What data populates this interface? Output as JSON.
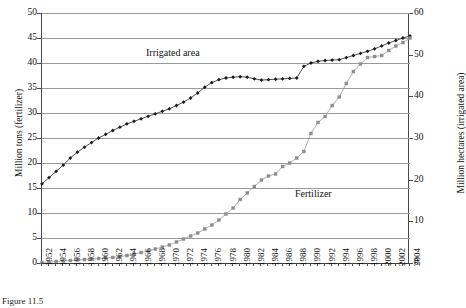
{
  "chart_data": {
    "type": "line",
    "title": "",
    "xlabel": "",
    "grid": true,
    "legend_position": "inline-annotation",
    "x": [
      1952,
      1953,
      1954,
      1955,
      1956,
      1957,
      1958,
      1959,
      1960,
      1961,
      1962,
      1963,
      1964,
      1965,
      1966,
      1967,
      1968,
      1969,
      1970,
      1971,
      1972,
      1973,
      1974,
      1975,
      1976,
      1977,
      1978,
      1979,
      1980,
      1981,
      1982,
      1983,
      1984,
      1985,
      1986,
      1987,
      1988,
      1989,
      1990,
      1991,
      1992,
      1993,
      1994,
      1995,
      1996,
      1997,
      1998,
      1999,
      2000,
      2001,
      2002,
      2003,
      2004
    ],
    "xtick_labels": [
      "1952",
      "1954",
      "1956",
      "1958",
      "1960",
      "1962",
      "1964",
      "1966",
      "1968",
      "1970",
      "1972",
      "1974",
      "1976",
      "1978",
      "1980",
      "1982",
      "1984",
      "1986",
      "1988",
      "1990",
      "1992",
      "1994",
      "1996",
      "1998",
      "2000",
      "2002",
      "2004"
    ],
    "axes": [
      {
        "id": "left",
        "ylabel": "Million tons (fertilizer)",
        "ylim": [
          0,
          50
        ],
        "yticks": [
          0,
          5,
          10,
          15,
          20,
          25,
          30,
          35,
          40,
          45,
          50
        ]
      },
      {
        "id": "right",
        "ylabel": "Million hectares (irrigated area)",
        "ylim": [
          0,
          60
        ],
        "yticks": [
          0,
          10,
          20,
          30,
          40,
          50,
          60
        ]
      }
    ],
    "series": [
      {
        "name": "Irrigated area",
        "axis": "right",
        "unit": "Million hectares",
        "color": "#1a1a1a",
        "marker": "diamond",
        "values": [
          19.0,
          20.5,
          22.0,
          23.5,
          25.2,
          26.6,
          27.8,
          28.9,
          30.0,
          30.9,
          31.8,
          32.6,
          33.4,
          34.0,
          34.6,
          35.2,
          35.8,
          36.4,
          37.0,
          37.8,
          38.6,
          39.6,
          40.8,
          42.2,
          43.3,
          44.0,
          44.4,
          44.6,
          44.7,
          44.6,
          44.2,
          43.9,
          44.0,
          44.1,
          44.2,
          44.3,
          44.4,
          47.2,
          48.0,
          48.4,
          48.6,
          48.7,
          48.8,
          49.3,
          49.8,
          50.3,
          50.8,
          51.4,
          52.1,
          52.8,
          53.4,
          54.0,
          54.5
        ]
      },
      {
        "name": "Fertilizer",
        "axis": "left",
        "unit": "Million tons",
        "color": "#8d8d8d",
        "marker": "square",
        "values": [
          0.1,
          0.2,
          0.3,
          0.4,
          0.5,
          0.6,
          0.7,
          0.8,
          0.9,
          1.0,
          1.1,
          1.3,
          1.5,
          1.8,
          2.1,
          2.4,
          2.8,
          3.2,
          3.6,
          4.2,
          4.8,
          5.4,
          6.0,
          6.8,
          7.6,
          8.6,
          9.8,
          11.0,
          12.7,
          14.0,
          15.3,
          16.6,
          17.4,
          17.8,
          19.3,
          20.0,
          21.0,
          22.3,
          25.9,
          28.1,
          29.3,
          31.5,
          33.2,
          35.9,
          38.3,
          39.8,
          41.1,
          41.3,
          41.5,
          42.5,
          43.4,
          44.1,
          45.0
        ]
      }
    ],
    "annotations": [
      {
        "text": "Irrigated area",
        "series": "Irrigated area"
      },
      {
        "text": "Fertilizer",
        "series": "Fertilizer"
      }
    ]
  },
  "caption": {
    "text": "Figure 11.5"
  }
}
